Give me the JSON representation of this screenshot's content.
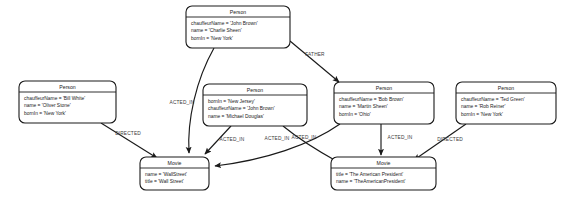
{
  "diagram": {
    "background_color": "#ffffff",
    "stroke_color": "#1a1a1a",
    "label_color": "#3a3a3a",
    "nodes": [
      {
        "id": "charlie",
        "label": "Person",
        "properties": [
          "chauffeurName = 'John Brown'",
          "name = 'Charlie Sheen'",
          "bornIn = 'New York'"
        ],
        "x": 186,
        "y": 6,
        "w": 104,
        "h": 42
      },
      {
        "id": "oliver",
        "label": "Person",
        "properties": [
          "chauffeurName = 'Bill White'",
          "name = 'Oliver Stone'",
          "bornIn = 'New York'"
        ],
        "x": 19,
        "y": 81,
        "w": 97,
        "h": 42
      },
      {
        "id": "michael",
        "label": "Person",
        "properties": [
          "bornIn = 'New Jersey'",
          "chauffeurName = 'John Brown'",
          "name = 'Michael Douglas'"
        ],
        "x": 203,
        "y": 84,
        "w": 104,
        "h": 42
      },
      {
        "id": "martin",
        "label": "Person",
        "properties": [
          "chauffeurName = 'Bob Brown'",
          "name = 'Martin Sheen'",
          "bornIn = 'Ohio'"
        ],
        "x": 334,
        "y": 82,
        "w": 100,
        "h": 42
      },
      {
        "id": "rob",
        "label": "Person",
        "properties": [
          "chauffeurName = 'Ted Green'",
          "name = 'Rob Reiner'",
          "bornIn = 'New York'"
        ],
        "x": 456,
        "y": 82,
        "w": 100,
        "h": 42
      },
      {
        "id": "wallstreet",
        "label": "Movie",
        "properties": [
          "name = 'WallStreet'",
          "title = 'Wall Street'"
        ],
        "x": 140,
        "y": 157,
        "w": 69,
        "h": 33
      },
      {
        "id": "americanpresident",
        "label": "Movie",
        "properties": [
          "title = 'The American President'",
          "name = 'TheAmericanPresident'"
        ],
        "x": 331,
        "y": 157,
        "w": 105,
        "h": 33
      }
    ],
    "edges": [
      {
        "id": "charlie-acted-wallstreet",
        "label": "ACTED_IN",
        "from": "charlie",
        "to": "wallstreet",
        "path": "M 214 48 C 196 80 187 120 189 153",
        "label_x": 182,
        "label_y": 104
      },
      {
        "id": "charlie-father-martin",
        "label": "FATHER",
        "from": "charlie",
        "to": "martin",
        "path": "M 290 41 L 339 82",
        "label_x": 315,
        "label_y": 56
      },
      {
        "id": "oliver-directed-wallstreet",
        "label": "DIRECTED",
        "from": "oliver",
        "to": "wallstreet",
        "path": "M 101 123 L 157 158",
        "label_x": 128,
        "label_y": 135
      },
      {
        "id": "michael-acted-wallstreet",
        "label": "ACTED_IN",
        "from": "michael",
        "to": "wallstreet",
        "path": "M 231 126 L 205 154",
        "label_x": 232,
        "label_y": 141
      },
      {
        "id": "michael-acted-americanpresident",
        "label": "ACTED_IN",
        "from": "michael",
        "to": "americanpresident",
        "path": "M 283 126 C 300 140 320 152 338 162",
        "label_x": 304,
        "label_y": 139
      },
      {
        "id": "martin-acted-wallstreet",
        "label": "ACTED_IN",
        "from": "martin",
        "to": "wallstreet",
        "path": "M 340 124 C 310 145 265 160 215 166",
        "label_x": 277,
        "label_y": 140
      },
      {
        "id": "martin-acted-americanpresident",
        "label": "ACTED_IN",
        "from": "martin",
        "to": "americanpresident",
        "path": "M 381 124 L 381 155",
        "label_x": 400,
        "label_y": 139
      },
      {
        "id": "rob-directed-americanpresident",
        "label": "DIRECTED",
        "from": "rob",
        "to": "americanpresident",
        "path": "M 466 124 L 414 160",
        "label_x": 450,
        "label_y": 141
      }
    ]
  }
}
